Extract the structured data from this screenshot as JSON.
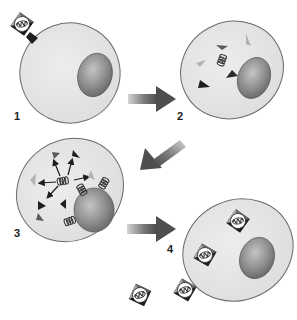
{
  "diagram": {
    "type": "viral replication cycle",
    "colors": {
      "background": "#ffffff",
      "cytoplasm": "#e4e4e4",
      "cell_outline": "#6a6a6a",
      "nucleus_light": "#b5b5b5",
      "nucleus_dark": "#6f6f6f",
      "capsid_dark": "#1e1e1e",
      "capsid_mid": "#6b6b6b",
      "capsid_light": "#a8a8a8",
      "arrow_dark": "#555555",
      "arrow_light": "#c8c8c8"
    },
    "steps": [
      {
        "id": 1,
        "label": "1",
        "description": "Virus particle attaches to cell membrane"
      },
      {
        "id": 2,
        "label": "2",
        "description": "Viral coat fragments and genome released into cytoplasm"
      },
      {
        "id": 3,
        "label": "3",
        "description": "Genome replicated; capsid proteins synthesized; copies near nucleus"
      },
      {
        "id": 4,
        "label": "4",
        "description": "New virus particles assembled and released from cell"
      }
    ],
    "arrows": [
      {
        "from": 1,
        "to": 2,
        "direction": "right"
      },
      {
        "from": 2,
        "to": 3,
        "direction": "down-left"
      },
      {
        "from": 3,
        "to": 4,
        "direction": "right"
      }
    ]
  }
}
